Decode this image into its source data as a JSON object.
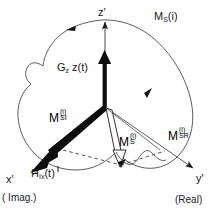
{
  "figure": {
    "kind": "vector-diagram",
    "title_label": "M_S(i)",
    "background_color": "#ffffff",
    "stroke_color": "#1a1a1a",
    "fill_color": "#000000"
  },
  "labels": {
    "magnetization_title": {
      "base": "M",
      "sub": "S",
      "arg": "(i)"
    },
    "z_axis": {
      "text": "z",
      "prime": "′"
    },
    "gradient_term": {
      "base": "G",
      "sub": "z",
      "rest": " z(t)"
    },
    "m_si": {
      "base": "M",
      "sub": "SI",
      "sup": "(i)"
    },
    "m_s": {
      "base": "M",
      "sub": "S",
      "sup": "(i)"
    },
    "m_sr": {
      "base": "M",
      "sub": "SR",
      "sup": "(i)"
    },
    "x_axis": {
      "text": "x",
      "prime": "′"
    },
    "x_axis_note": "( Imag.)",
    "h_ix": {
      "base": "H",
      "sub": "Ix",
      "rest": "(t)"
    },
    "y_axis": {
      "text": "y",
      "prime": "′"
    },
    "y_axis_note": "(Real)"
  },
  "geometry": {
    "origin": {
      "x": 105,
      "y": 107
    },
    "z_axis_tip": {
      "x": 105,
      "y": 18
    },
    "x_axis_tip": {
      "x": 30,
      "y": 177
    },
    "y_axis_tip": {
      "x": 196,
      "y": 170
    }
  }
}
